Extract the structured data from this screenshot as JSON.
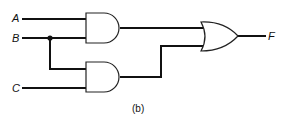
{
  "diagram": {
    "type": "logic-circuit",
    "inputs": [
      "A",
      "B",
      "C"
    ],
    "output": "F",
    "caption": "(b)",
    "gates": [
      {
        "id": "and1",
        "type": "AND",
        "inputs": [
          "A",
          "B"
        ]
      },
      {
        "id": "and2",
        "type": "AND",
        "inputs": [
          "B",
          "C"
        ]
      },
      {
        "id": "or1",
        "type": "OR",
        "inputs": [
          "and1",
          "and2"
        ],
        "output": "F"
      }
    ]
  }
}
